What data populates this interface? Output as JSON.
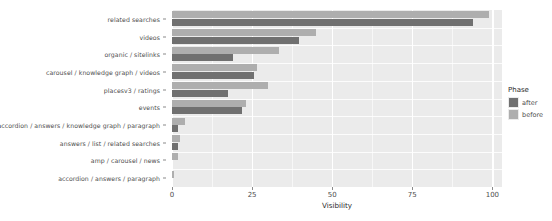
{
  "chart_data": {
    "type": "bar",
    "orientation": "horizontal",
    "title": "",
    "xlabel": "Visibility",
    "ylabel": "",
    "xlim": [
      0,
      103
    ],
    "xticks": [
      0,
      25,
      50,
      75,
      100
    ],
    "xticklabels": [
      "0",
      "25",
      "50",
      "75",
      "100"
    ],
    "grid": true,
    "legend": {
      "title": "Phase",
      "position": "right",
      "entries": [
        {
          "name": "after",
          "color": "#707070"
        },
        {
          "name": "before",
          "color": "#aeaeae"
        }
      ]
    },
    "categories": [
      "related searches",
      "videos",
      "organic / sitelinks",
      "carousel / knowledge graph / videos",
      "placesv3 / ratings",
      "events",
      "accordion / answers / knowledge graph / paragraph",
      "answers / list / related searches",
      "amp / carousel / news",
      "accordion / answers / paragraph"
    ],
    "series": [
      {
        "name": "before",
        "color": "#aeaeae",
        "values": [
          99.0,
          45.0,
          33.5,
          26.5,
          30.0,
          23.0,
          4.0,
          2.5,
          2.0,
          0.6
        ]
      },
      {
        "name": "after",
        "color": "#707070",
        "values": [
          94.0,
          39.5,
          19.0,
          25.5,
          17.5,
          22.0,
          2.0,
          1.8,
          0.0,
          0.0
        ]
      }
    ],
    "panel_background": "#ebebeb",
    "gridline_color": "#ffffff"
  }
}
